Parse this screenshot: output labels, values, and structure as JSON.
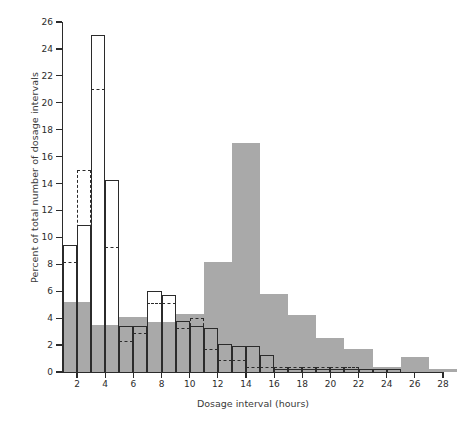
{
  "chart_data": {
    "type": "bar",
    "title": "",
    "xlabel": "Dosage interval (hours)",
    "ylabel": "Percent of total number of dosage intervals",
    "xlim": [
      1,
      28
    ],
    "ylim": [
      0,
      26
    ],
    "xticks": [
      2,
      4,
      6,
      8,
      10,
      12,
      14,
      16,
      18,
      20,
      22,
      24,
      26,
      28
    ],
    "yticks": [
      0,
      2,
      4,
      6,
      8,
      10,
      12,
      14,
      16,
      18,
      20,
      22,
      24,
      26
    ],
    "grid": false,
    "legend": "none",
    "bin_width": 2,
    "series": [
      {
        "name": "gray-filled-histogram",
        "style": "filled",
        "color": "#a9a9a9",
        "bin_starts": [
          1,
          3,
          5,
          7,
          9,
          11,
          13,
          15,
          17,
          19,
          21,
          23,
          25,
          27
        ],
        "values": [
          5.2,
          3.5,
          4.1,
          3.7,
          4.3,
          8.2,
          17.0,
          5.8,
          4.2,
          2.5,
          1.7,
          0.4,
          1.1,
          0.2
        ]
      },
      {
        "name": "solid-outline-histogram",
        "style": "solid-outline",
        "color": "#2b2b2b",
        "bin_starts": [
          1,
          2,
          3,
          4,
          5,
          6,
          7,
          8,
          9,
          10,
          11,
          12,
          13,
          14,
          15,
          16,
          17,
          18,
          19,
          20,
          21,
          22,
          23,
          24,
          25,
          26
        ],
        "values": [
          9.4,
          10.9,
          25.0,
          14.3,
          3.4,
          3.4,
          6.0,
          5.7,
          3.8,
          3.4,
          3.3,
          2.1,
          1.9,
          1.9,
          1.3,
          0.2,
          0.2,
          0.2,
          0.2,
          0.2,
          0.2,
          0.2,
          0.2,
          0.2,
          0.0,
          0.0
        ]
      },
      {
        "name": "dashed-outline-histogram",
        "style": "dashed-outline",
        "color": "#2b2b2b",
        "bin_starts": [
          1,
          2,
          3,
          4,
          5,
          6,
          7,
          8,
          9,
          10,
          11,
          12,
          13,
          14,
          15,
          16,
          17,
          18,
          19,
          20,
          21,
          22,
          23,
          24
        ],
        "values": [
          8.2,
          15.0,
          21.0,
          9.3,
          2.3,
          2.9,
          5.1,
          5.1,
          3.3,
          4.0,
          1.7,
          0.9,
          0.9,
          0.4,
          0.4,
          0.4,
          0.4,
          0.4,
          0.4,
          0.4,
          0.4,
          0.2,
          0.2,
          0.2
        ]
      }
    ]
  },
  "axes": {
    "xlabel": "Dosage interval (hours)",
    "ylabel": "Percent of total number of dosage intervals",
    "xtick_labels": [
      "2",
      "4",
      "6",
      "8",
      "10",
      "12",
      "14",
      "16",
      "18",
      "20",
      "22",
      "24",
      "26",
      "28"
    ],
    "ytick_labels": [
      "0",
      "2",
      "4",
      "6",
      "8",
      "10",
      "12",
      "14",
      "16",
      "18",
      "20",
      "22",
      "24",
      "26"
    ]
  }
}
